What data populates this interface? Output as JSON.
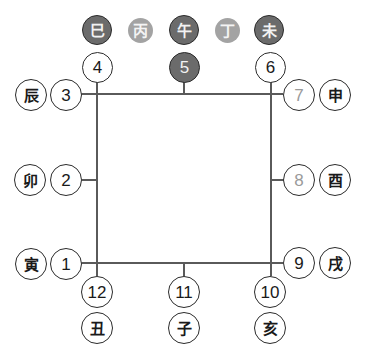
{
  "diagram": {
    "type": "palace-grid",
    "colors": {
      "line": "#5a5a5a",
      "outline_border": "#2b2b2b",
      "dark_fill": "#6b6b6b",
      "light_fill": "#a3a3a3",
      "dim_number": "#9a9a9a"
    },
    "top_stems": [
      {
        "label": "巳",
        "style": "dark"
      },
      {
        "label": "丙",
        "style": "light"
      },
      {
        "label": "午",
        "style": "dark"
      },
      {
        "label": "丁",
        "style": "light"
      },
      {
        "label": "未",
        "style": "dark"
      }
    ],
    "positions": [
      {
        "number": "1",
        "branch": "寅",
        "side": "left"
      },
      {
        "number": "2",
        "branch": "卯",
        "side": "left"
      },
      {
        "number": "3",
        "branch": "辰",
        "side": "left"
      },
      {
        "number": "4",
        "branch": "巳",
        "side": "top"
      },
      {
        "number": "5",
        "branch": "午",
        "side": "top",
        "highlighted": true
      },
      {
        "number": "6",
        "branch": "未",
        "side": "top"
      },
      {
        "number": "7",
        "branch": "申",
        "side": "right",
        "dimmed": true
      },
      {
        "number": "8",
        "branch": "酉",
        "side": "right",
        "dimmed": true
      },
      {
        "number": "9",
        "branch": "戌",
        "side": "right"
      },
      {
        "number": "10",
        "branch": "亥",
        "side": "bottom"
      },
      {
        "number": "11",
        "branch": "子",
        "side": "bottom"
      },
      {
        "number": "12",
        "branch": "丑",
        "side": "bottom"
      }
    ]
  }
}
